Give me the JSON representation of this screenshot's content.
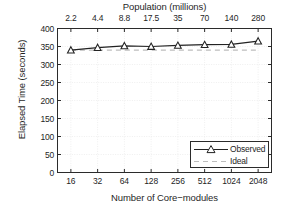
{
  "chart_data": {
    "type": "line",
    "title": "",
    "xlabel": "Number of Core−modules",
    "ylabel": "Elapsed Time (seconds)",
    "top_axis_label": "Population (millions)",
    "categories": [
      "16",
      "32",
      "64",
      "128",
      "256",
      "512",
      "1024",
      "2048"
    ],
    "top_categories": [
      "2.2",
      "4.4",
      "8.8",
      "17.5",
      "35",
      "70",
      "140",
      "280"
    ],
    "yticks": [
      "0",
      "50",
      "100",
      "150",
      "200",
      "250",
      "300",
      "350",
      "400"
    ],
    "ylim": [
      0,
      400
    ],
    "grid": true,
    "legend_position": "lower right",
    "series": [
      {
        "name": "Observed",
        "marker": "triangle",
        "linestyle": "solid",
        "color": "#222222",
        "values": [
          340,
          347,
          352,
          350,
          353,
          355,
          356,
          365
        ]
      },
      {
        "name": "Ideal",
        "marker": "none",
        "linestyle": "dashed",
        "color": "#b9b9b9",
        "values": [
          340,
          340,
          340,
          340,
          340,
          340,
          340,
          340
        ]
      }
    ]
  },
  "axes": {
    "top_title": "Population (millions)",
    "bottom_title": "Number of Core−modules",
    "y_title": "Elapsed Time (seconds)"
  },
  "legend": {
    "items": [
      {
        "label": "Observed"
      },
      {
        "label": "Ideal"
      }
    ]
  },
  "colors": {
    "axis": "#2b2b2b",
    "grid": "#ededed",
    "observed": "#222222",
    "ideal": "#bdbdbd",
    "background": "#ffffff"
  }
}
